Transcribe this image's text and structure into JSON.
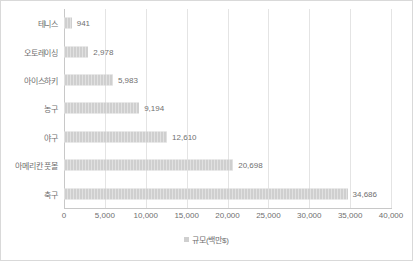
{
  "chart_data": {
    "type": "bar",
    "orientation": "horizontal",
    "title": "",
    "xlabel": "",
    "ylabel": "",
    "categories": [
      "테니스",
      "오토레이싱",
      "아이스하키",
      "농구",
      "야구",
      "아메리칸 풋볼",
      "축구"
    ],
    "values": [
      941,
      2978,
      5983,
      9194,
      12610,
      20698,
      34686
    ],
    "value_labels": [
      "941",
      "2,978",
      "5,983",
      "9,194",
      "12,610",
      "20,698",
      "34,686"
    ],
    "xlim": [
      0,
      40000
    ],
    "xticks": [
      0,
      5000,
      10000,
      15000,
      20000,
      25000,
      30000,
      35000,
      40000
    ],
    "xtick_labels": [
      "0",
      "5,000",
      "10,000",
      "15,000",
      "20,000",
      "25,000",
      "30,000",
      "35,000",
      "40,000"
    ],
    "grid": true,
    "grid_axis": "x",
    "legend_position": "bottom",
    "series": [
      {
        "name": "규모(백만$)",
        "color": "#cfcfcf",
        "values": [
          941,
          2978,
          5983,
          9194,
          12610,
          20698,
          34686
        ]
      }
    ]
  },
  "legend": {
    "marker": "square-swatch-icon",
    "label": "규모(백만$)",
    "color": "#cfcfcf"
  },
  "colors": {
    "bar": "#cfcfcf",
    "gridline": "#e4e4e4",
    "axis": "#c8c8c8",
    "text": "#6f6f6f",
    "border": "#d9d9d9",
    "background": "#ffffff"
  }
}
